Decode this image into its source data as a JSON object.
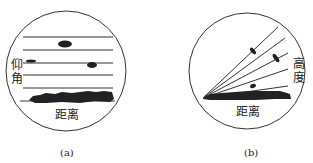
{
  "panel_a": {
    "vertical_label": "仰角",
    "horizontal_label": "距离",
    "caption": "(a)"
  },
  "panel_b": {
    "vertical_label": "高度",
    "horizontal_label": "距离",
    "caption": "(b)"
  },
  "colors": {
    "ink": "#222222",
    "background": "#ffffff"
  }
}
